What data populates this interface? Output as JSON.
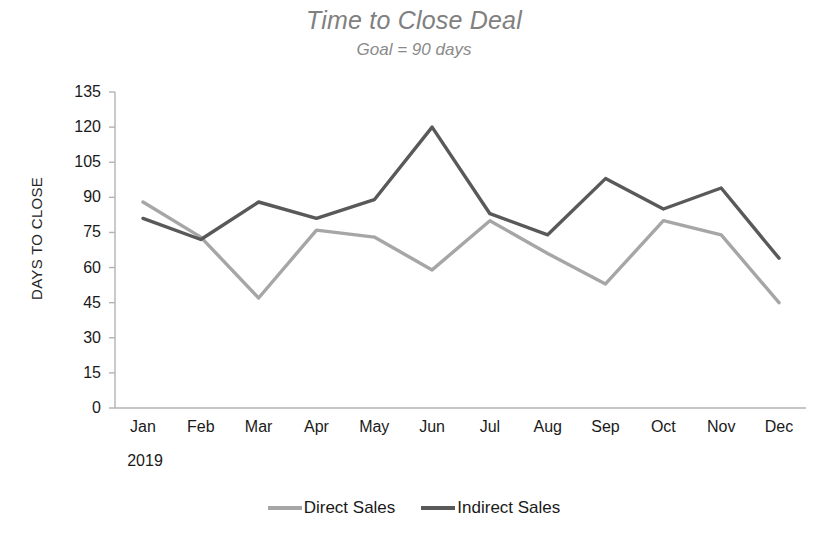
{
  "chart_data": {
    "type": "line",
    "title": "Time to Close Deal",
    "subtitle": "Goal = 90 days",
    "xlabel": "",
    "ylabel": "DAYS TO CLOSE",
    "period_label": "2019",
    "categories": [
      "Jan",
      "Feb",
      "Mar",
      "Apr",
      "May",
      "Jun",
      "Jul",
      "Aug",
      "Sep",
      "Oct",
      "Nov",
      "Dec"
    ],
    "ylim": [
      0,
      135
    ],
    "yticks": [
      135,
      120,
      105,
      90,
      75,
      60,
      45,
      30,
      15,
      0
    ],
    "grid": false,
    "legend_position": "bottom",
    "series": [
      {
        "name": "Direct Sales",
        "color": "#a6a6a6",
        "values": [
          88,
          73,
          47,
          76,
          73,
          59,
          80,
          66,
          53,
          80,
          74,
          45
        ]
      },
      {
        "name": "Indirect Sales",
        "color": "#595959",
        "values": [
          81,
          72,
          88,
          81,
          89,
          120,
          83,
          74,
          98,
          85,
          94,
          64
        ]
      }
    ]
  }
}
